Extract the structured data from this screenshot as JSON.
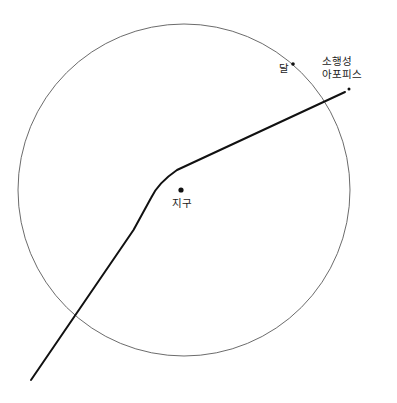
{
  "figure": {
    "type": "astronomy-trajectory-diagram",
    "background_color": "#ffffff",
    "width": 397,
    "height": 403
  },
  "labels": {
    "earth": "지구",
    "moon": "달",
    "asteroid_line1": "소행성",
    "asteroid_line2": "아포피스"
  },
  "diagram_data": {
    "type": "diagram",
    "title": "",
    "orbit_circle": {
      "name": "moon-orbit",
      "center_x": 184,
      "center_y": 190,
      "radius": 166,
      "stroke": "#5a5a5a",
      "stroke_width": 0.9,
      "fill": "none"
    },
    "bodies": [
      {
        "name": "earth",
        "x": 181,
        "y": 190,
        "radius": 2.6,
        "color": "#111111",
        "label": "지구"
      },
      {
        "name": "moon",
        "x": 293,
        "y": 64,
        "radius": 1.8,
        "color": "#111111",
        "label": "달"
      },
      {
        "name": "asteroid",
        "x": 349,
        "y": 89,
        "radius": 1.5,
        "color": "#111111",
        "label": "소행성 아포피스"
      }
    ],
    "trajectory": {
      "name": "apophis-path",
      "stroke": "#111111",
      "stroke_width": 2,
      "start_x": 31,
      "start_y": 380,
      "bend_x": 162,
      "bend_y": 174,
      "end_x": 345,
      "end_y": 92,
      "path": "M 31,380 L 134,229 L 152,196 Q 160,180 178,169 L 345,92"
    }
  }
}
